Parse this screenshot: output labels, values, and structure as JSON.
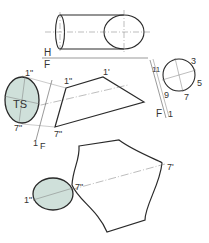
{
  "figure": {
    "colors": {
      "line": "#2a2a2a",
      "thin_line": "#7a7a7a",
      "fill_true_size": "#cfe0da",
      "background": "#ffffff"
    },
    "labels": {
      "fold_h": "H",
      "fold_f_top": "F",
      "fold_1": "1",
      "fold_f_right": "F",
      "fold_1_right": "1",
      "fold_1_left": "1",
      "fold_f_left": "F",
      "point_1pp_top": "1\"",
      "point_1pp_mid": "1\"",
      "point_1p_mid": "1'",
      "point_7pp_left": "7\"",
      "point_7pp_mid": "7\"",
      "true_size": "TS",
      "circle_3": "3",
      "circle_5": "5",
      "circle_7": "7",
      "circle_9": "9",
      "circle_11": "11",
      "point_7p_bottom": "7'",
      "point_7pp_bottom": "7\"",
      "point_1pp_bottom": "1\""
    }
  }
}
